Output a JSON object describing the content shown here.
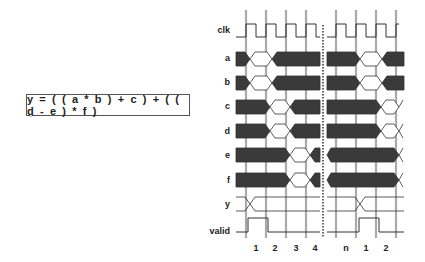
{
  "equation": "y = ( ( a * b ) + c ) + ( ( d - e ) * f )",
  "signals": [
    {
      "name": "clk",
      "type": "clock"
    },
    {
      "name": "a",
      "type": "bus"
    },
    {
      "name": "b",
      "type": "bus"
    },
    {
      "name": "c",
      "type": "bus"
    },
    {
      "name": "d",
      "type": "bus"
    },
    {
      "name": "e",
      "type": "bus"
    },
    {
      "name": "f",
      "type": "bus"
    },
    {
      "name": "y",
      "type": "bus"
    },
    {
      "name": "valid",
      "type": "logic"
    }
  ],
  "cycle_labels": [
    "1",
    "2",
    "3",
    "4",
    "n",
    "1",
    "2"
  ],
  "colors": {
    "bus_fill": "#3a3a3a",
    "grid_line": "#aaaaaa",
    "wave_line": "#333333",
    "text": "#222222"
  }
}
